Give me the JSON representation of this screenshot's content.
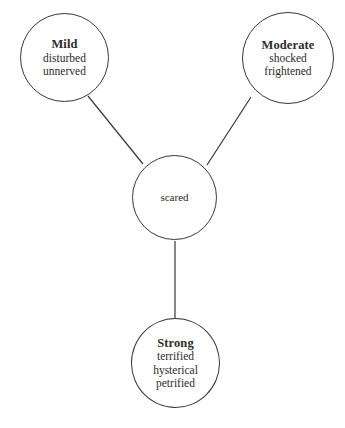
{
  "diagram": {
    "type": "semantic-gradation-network",
    "background_color": "#ffffff",
    "line_color": "#3a3636",
    "text_color": "#2e2b2b",
    "center": {
      "id": "scared",
      "label": "scared",
      "bold": false
    },
    "nodes": [
      {
        "id": "mild",
        "title": "Mild",
        "terms": [
          "disturbed",
          "unnerved"
        ]
      },
      {
        "id": "moderate",
        "title": "Moderate",
        "terms": [
          "shocked",
          "frightened"
        ]
      },
      {
        "id": "strong",
        "title": "Strong",
        "terms": [
          "terrified",
          "hysterical",
          "petrified"
        ]
      }
    ],
    "edges": [
      {
        "from": "mild",
        "to": "scared",
        "x1": 88,
        "y1": 96,
        "x2": 143,
        "y2": 164
      },
      {
        "from": "moderate",
        "to": "scared",
        "x1": 251,
        "y1": 97,
        "x2": 207,
        "y2": 165
      },
      {
        "from": "scared",
        "to": "strong",
        "x1": 175,
        "y1": 241,
        "x2": 175,
        "y2": 318
      }
    ]
  }
}
